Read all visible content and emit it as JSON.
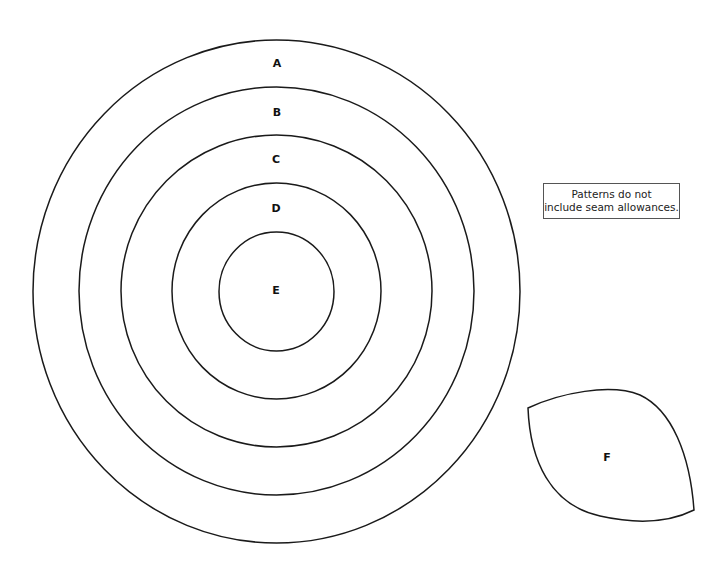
{
  "pattern": {
    "circles": [
      {
        "label": "A",
        "cx": 276.5,
        "cy": 291.5,
        "rx": 243.5,
        "ry": 251.5,
        "label_x": 277,
        "label_y": 64
      },
      {
        "label": "B",
        "cx": 276.5,
        "cy": 291,
        "rx": 197.5,
        "ry": 204,
        "label_x": 277,
        "label_y": 113
      },
      {
        "label": "C",
        "cx": 276.5,
        "cy": 291,
        "rx": 155.5,
        "ry": 156,
        "label_x": 276,
        "label_y": 160
      },
      {
        "label": "D",
        "cx": 276.5,
        "cy": 291,
        "rx": 104.5,
        "ry": 108,
        "label_x": 276,
        "label_y": 209
      },
      {
        "label": "E",
        "cx": 276.5,
        "cy": 291.5,
        "rx": 57.5,
        "ry": 59.5,
        "label_x": 276,
        "label_y": 291
      }
    ],
    "leaf": {
      "label": "F",
      "label_x": 607,
      "label_y": 458
    },
    "note": {
      "line1": "Patterns do not",
      "line2": "include seam allowances."
    }
  }
}
